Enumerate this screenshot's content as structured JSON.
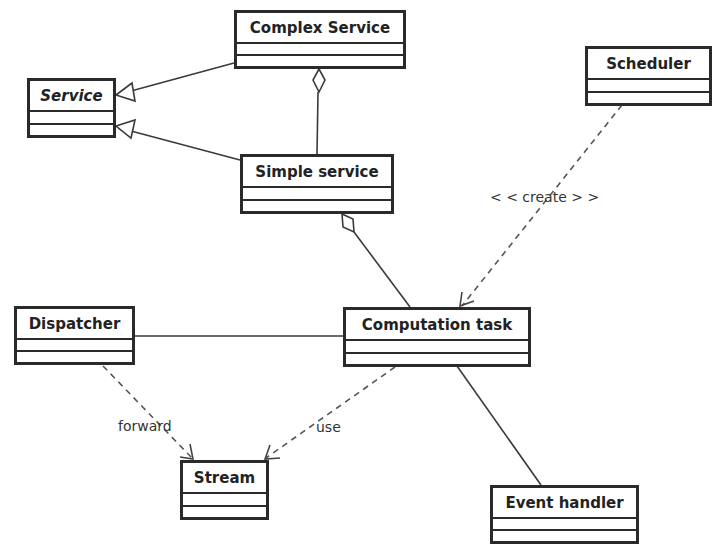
{
  "diagram": {
    "type": "uml-class-diagram",
    "classes": [
      {
        "id": "complex_service",
        "name": "Complex Service",
        "abstract": false
      },
      {
        "id": "service",
        "name": "Service",
        "abstract": true
      },
      {
        "id": "simple_service",
        "name": "Simple service",
        "abstract": false
      },
      {
        "id": "scheduler",
        "name": "Scheduler",
        "abstract": false
      },
      {
        "id": "dispatcher",
        "name": "Dispatcher",
        "abstract": false
      },
      {
        "id": "computation_task",
        "name": "Computation task",
        "abstract": false
      },
      {
        "id": "stream",
        "name": "Stream",
        "abstract": false
      },
      {
        "id": "event_handler",
        "name": "Event handler",
        "abstract": false
      }
    ],
    "relations": [
      {
        "from": "Complex Service",
        "to": "Service",
        "kind": "generalization",
        "label": ""
      },
      {
        "from": "Simple service",
        "to": "Service",
        "kind": "generalization",
        "label": ""
      },
      {
        "from": "Simple service",
        "to": "Complex Service",
        "kind": "aggregation",
        "label": ""
      },
      {
        "from": "Computation task",
        "to": "Simple service",
        "kind": "aggregation",
        "label": ""
      },
      {
        "from": "Scheduler",
        "to": "Computation task",
        "kind": "dependency",
        "label": "<<create>>"
      },
      {
        "from": "Dispatcher",
        "to": "Computation task",
        "kind": "association",
        "label": ""
      },
      {
        "from": "Dispatcher",
        "to": "Stream",
        "kind": "dependency",
        "label": "forward"
      },
      {
        "from": "Computation task",
        "to": "Stream",
        "kind": "dependency",
        "label": "use"
      },
      {
        "from": "Computation task",
        "to": "Event handler",
        "kind": "association",
        "label": ""
      }
    ],
    "labels": {
      "create": "< < create > >",
      "forward": "forward",
      "use": "use"
    },
    "colors": {
      "line": "#2a2a2a",
      "text": "#222222",
      "background": "#ffffff"
    }
  }
}
